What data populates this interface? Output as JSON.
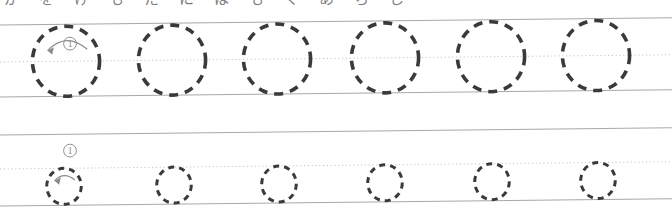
{
  "worksheet": {
    "header_clipped_text": "か･を･け･も･た･に･は･も･く･あ･ら･し",
    "page_width": 672,
    "page_height": 223,
    "background_color": "#ffffff",
    "skew_degrees": -0.62,
    "guide_line_color": "#a8a8a8",
    "center_line_color": "#bdbdbd",
    "stroke_color": "#3a3a3a",
    "annotation_color": "#8a8a8a",
    "rows": [
      {
        "row_name": "row-1-large",
        "glyph": "の",
        "top_line_y": 25,
        "center_line_y": 62,
        "bottom_line_y": 97,
        "circle_radius": 35,
        "dash_pattern": "9 7",
        "stroke_width": 3.6,
        "circle_centers_x": [
          66,
          172,
          277,
          385,
          491,
          596
        ],
        "circle_center_offset_y": 0,
        "stroke_order_number": "①",
        "stroke_number_x": 56,
        "stroke_number_y": 43,
        "arrow_direction": "counter-clockwise"
      },
      {
        "row_name": "row-2-small",
        "glyph": "の",
        "top_line_y": 135,
        "center_line_y": 169,
        "bottom_line_y": 206,
        "circle_radius": 18,
        "dash_pattern": "6 5",
        "stroke_width": 3.0,
        "circle_centers_x": [
          64,
          174,
          279,
          385,
          492,
          598
        ],
        "circle_center_offset_y": 18,
        "stroke_order_number": "①",
        "stroke_number_x": 56,
        "stroke_number_y": 150,
        "arrow_direction": "counter-clockwise"
      }
    ]
  }
}
